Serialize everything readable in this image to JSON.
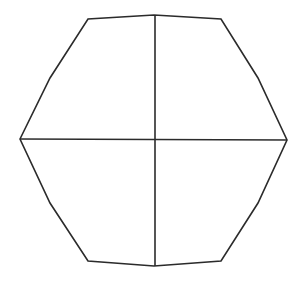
{
  "diagram": {
    "type": "polygon-with-axes",
    "background": "#ffffff",
    "stroke_color": "#2b2b2b",
    "polygon": {
      "name": "hexagon-like outline",
      "points": [
        [
          20,
          139
        ],
        [
          50,
          78
        ],
        [
          88,
          19
        ],
        [
          154,
          15
        ],
        [
          221,
          19
        ],
        [
          258,
          78
        ],
        [
          287,
          140
        ],
        [
          258,
          203
        ],
        [
          221,
          261
        ],
        [
          154,
          266
        ],
        [
          88,
          261
        ],
        [
          50,
          203
        ]
      ]
    },
    "vertical_axis": {
      "x1": 155,
      "y1": 15,
      "x2": 155,
      "y2": 266
    },
    "horizontal_axis": {
      "x1": 20,
      "y1": 139,
      "x2": 287,
      "y2": 140
    }
  }
}
